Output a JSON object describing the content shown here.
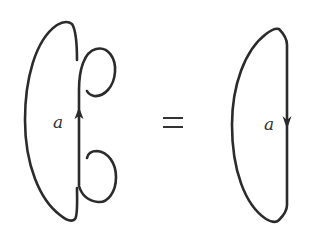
{
  "diagram": {
    "type": "knot/skein relation",
    "left_figure": {
      "description": "closed strand with two kinks (curls) on the right side, oriented upward",
      "label": "a",
      "arrow_direction": "up",
      "kink_count": 2
    },
    "relation_symbol": "=",
    "right_figure": {
      "description": "closed loop without kinks, oriented downward",
      "label": "a",
      "arrow_direction": "down"
    },
    "colors": {
      "stroke": "#2b2b2b",
      "background": "#ffffff"
    }
  }
}
